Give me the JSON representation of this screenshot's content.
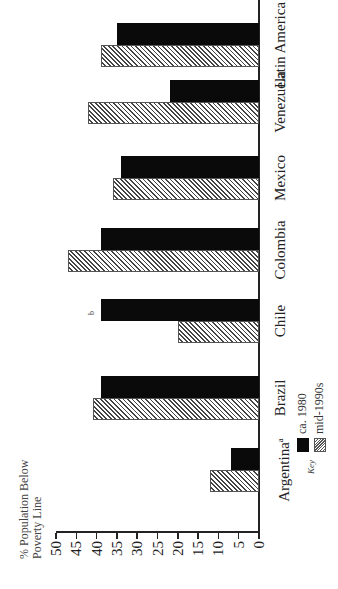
{
  "chart_data": {
    "type": "bar",
    "orientation": "vertical chart, page rotated 90 degrees counterclockwise",
    "title": "",
    "ylabel": "% Population Below Poverty Line",
    "xlabel": "",
    "ylim": [
      0,
      50
    ],
    "yticks": [
      0,
      5,
      10,
      15,
      20,
      25,
      30,
      35,
      40,
      45,
      50
    ],
    "categories": [
      "Argentina",
      "Brazil",
      "Chile",
      "Colombia",
      "Mexico",
      "Venezuela",
      "Latin America"
    ],
    "category_footnotes": {
      "Argentina": "a",
      "Chile": "b"
    },
    "series": [
      {
        "name": "ca. 1980",
        "fill": "solid black",
        "color": "#0a0a0a",
        "values": [
          7,
          39,
          39,
          39,
          34,
          22,
          35
        ]
      },
      {
        "name": "mid-1990s",
        "fill": "diagonal hatch",
        "color": "#444444",
        "values": [
          12,
          41,
          20,
          47,
          36,
          42,
          39
        ]
      }
    ],
    "legend": {
      "title": "Key",
      "position": "below x-axis, left"
    },
    "grid": false
  },
  "axis": {
    "title_line1": "% Population Below",
    "title_line2": "Poverty Line",
    "ticks": [
      "50",
      "45",
      "40",
      "35",
      "30",
      "25",
      "20",
      "15",
      "10",
      "5",
      "0"
    ]
  },
  "categories": [
    {
      "label": "Argentina",
      "sup": "a"
    },
    {
      "label": "Brazil",
      "sup": ""
    },
    {
      "label": "Chile",
      "sup": ""
    },
    {
      "label": "Colombia",
      "sup": ""
    },
    {
      "label": "Mexico",
      "sup": ""
    },
    {
      "label": "Venezuela",
      "sup": ""
    },
    {
      "label": "Latin America",
      "sup": ""
    }
  ],
  "annotations": {
    "chile_note": "b"
  },
  "legend": {
    "key": "Key",
    "item1": "ca. 1980",
    "item2": "mid-1990s"
  }
}
